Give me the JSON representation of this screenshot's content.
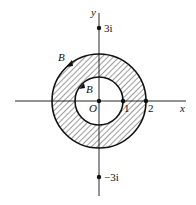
{
  "diagram": {
    "axes": {
      "x_label": "x",
      "y_label": "y",
      "origin_label": "O"
    },
    "points": {
      "one": "1",
      "two": "2",
      "plus_3i": "3i",
      "minus_3i": "−3i"
    },
    "curves": {
      "outer_label": "B",
      "inner_label": "B",
      "outer_radius": 2,
      "inner_radius": 1,
      "region": "hatched annulus 1 ≤ |z| ≤ 2"
    },
    "colors": {
      "stroke": "#111111",
      "background": "#ffffff"
    }
  }
}
